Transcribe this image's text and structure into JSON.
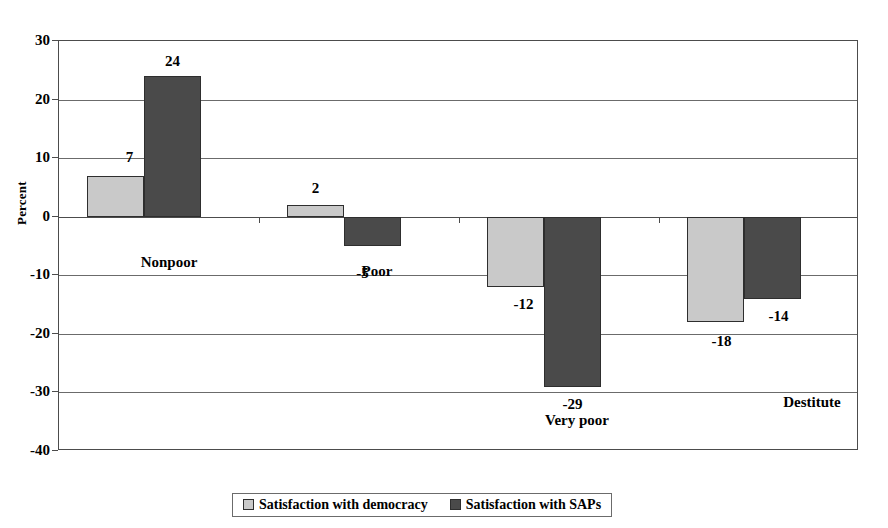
{
  "chart_data": {
    "type": "bar",
    "title": "",
    "subtitle": "",
    "xlabel": "",
    "ylabel": "Percent",
    "ylim": [
      -40,
      30
    ],
    "ytick_step": 10,
    "yticks": [
      30,
      20,
      10,
      0,
      -10,
      -20,
      -30,
      -40
    ],
    "ytick_labels": [
      "30",
      "20",
      "10",
      "0",
      "-10",
      "-20",
      "-30",
      "-40"
    ],
    "grid": true,
    "grid_axis": "y",
    "legend_position": "bottom",
    "orientation": "vertical",
    "categories": [
      "Nonpoor",
      "Poor",
      "Very poor",
      "Destitute"
    ],
    "series": [
      {
        "name": "Satisfaction with democracy",
        "color": "#c9c9c9",
        "values": [
          7,
          2,
          -12,
          -18
        ],
        "labels": [
          "7",
          "2",
          "-12",
          "-18"
        ]
      },
      {
        "name": "Satisfaction with SAPs",
        "color": "#4a4a4a",
        "values": [
          24,
          -5,
          -29,
          -14
        ],
        "labels": [
          "24",
          "-5",
          "-29",
          "-14"
        ]
      }
    ]
  },
  "legend": {
    "entries": [
      {
        "label": "Satisfaction with democracy",
        "swatch": "light-gray-swatch"
      },
      {
        "label": "Satisfaction with SAPs",
        "swatch": "dark-gray-swatch"
      }
    ]
  },
  "axis": {
    "y_title": "Percent"
  },
  "colors": {
    "series_light": "#c9c9c9",
    "series_dark": "#4a4a4a",
    "axis": "#4c4c4c",
    "grid": "#6b6b6b",
    "background": "#ffffff"
  }
}
